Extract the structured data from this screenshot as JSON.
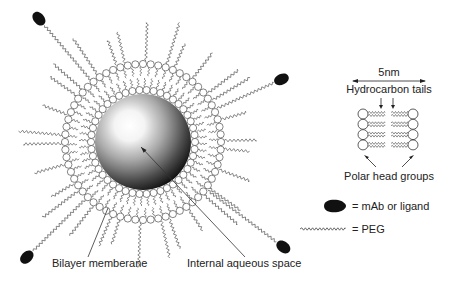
{
  "diagram": {
    "colors": {
      "ink": "#222222",
      "ligand": "#111111",
      "background": "#ffffff"
    },
    "liposome": {
      "center": [
        143,
        142
      ],
      "core_radius": 48,
      "inner_head_radius": 52,
      "outer_head_radius": 78,
      "head_radius": 3.6,
      "inner_head_count": 46,
      "outer_head_count": 64,
      "peg_count": 30,
      "ligands": [
        {
          "angle": 224,
          "tip": [
            40,
            20
          ]
        },
        {
          "angle": 322,
          "tip": [
            280,
            80
          ]
        },
        {
          "angle": 138,
          "tip": [
            28,
            256
          ]
        },
        {
          "angle": 40,
          "tip": [
            282,
            246
          ]
        }
      ]
    },
    "labels": {
      "bilayer": {
        "text": "Bilayer memberane",
        "x": 52,
        "y": 267,
        "leader": [
          [
            88,
            257
          ],
          [
            108,
            208
          ]
        ]
      },
      "aqueous": {
        "text": "Internal aqueous space",
        "x": 187,
        "y": 267,
        "leader": [
          [
            245,
            257
          ],
          [
            141,
            147
          ]
        ]
      }
    },
    "bilayer_schematic": {
      "scale_label": "5nm",
      "tails_label": "Hydrocarbon tails",
      "heads_label": "Polar head groups",
      "rows": 4,
      "left_x": 363,
      "right_x": 413,
      "top_y": 114,
      "row_gap": 10.3
    },
    "legend": [
      {
        "symbol": "ligand",
        "text": "= mAb or ligand"
      },
      {
        "symbol": "peg",
        "text": "= PEG"
      }
    ]
  }
}
